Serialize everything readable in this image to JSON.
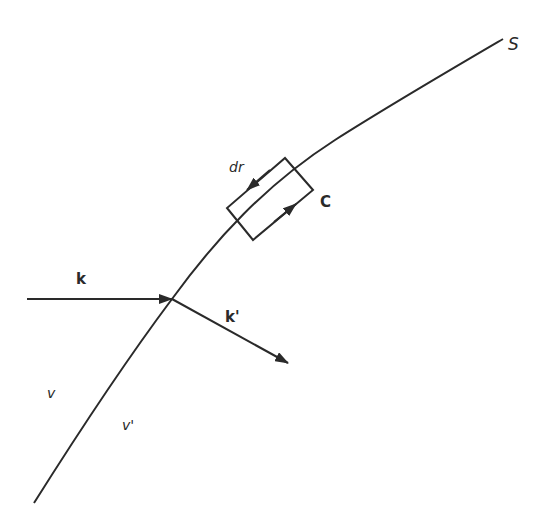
{
  "diagram": {
    "surface": {
      "label": "S"
    },
    "contour": {
      "label": "C",
      "element_label": "dr"
    },
    "incident_vector": {
      "label": "k"
    },
    "transmitted_vector": {
      "label": "k'"
    },
    "media": {
      "left": "v",
      "right": "v'"
    },
    "colors": {
      "ink": "#2a2a2a",
      "background": "#ffffff"
    }
  }
}
